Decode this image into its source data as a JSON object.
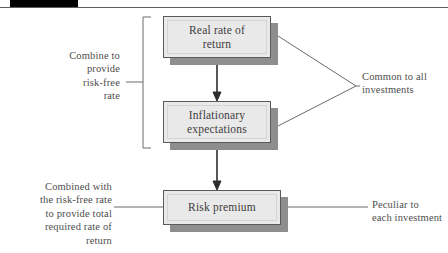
{
  "header": {
    "tab_marker": "",
    "rule": ""
  },
  "diagram": {
    "type": "flow-diagram",
    "nodes": [
      {
        "id": "real-rate",
        "label": "Real rate of\nreturn"
      },
      {
        "id": "inflation",
        "label": "Inflationary\nexpectations"
      },
      {
        "id": "risk-premium",
        "label": "Risk premium"
      }
    ],
    "node_labels": {
      "real_rate_line1": "Real rate of",
      "real_rate_line2": "return",
      "inflation_line1": "Inflationary",
      "inflation_line2": "expectations",
      "risk_premium": "Risk premium"
    },
    "annotations": {
      "combine_to_provide": "Combine to\nprovide\nrisk-free\nrate",
      "combined_with": "Combined with\nthe risk-free rate\nto provide total\nrequired rate of\nreturn",
      "common_to_all": "Common to all\ninvestments",
      "peculiar_to_each": "Peculiar to\neach investment"
    },
    "arrows": [
      {
        "from": "real-rate",
        "to": "inflation",
        "direction": "down"
      },
      {
        "from": "inflation",
        "to": "risk-premium",
        "direction": "down"
      }
    ],
    "colors": {
      "box_fill": "#e9e9e9",
      "box_border": "#5a5a5a",
      "box_shadow": "#8e8e8e",
      "line": "#6a6a6a",
      "text": "#3d3d3d",
      "header_tab": "#000000",
      "background": "#ffffff"
    }
  }
}
